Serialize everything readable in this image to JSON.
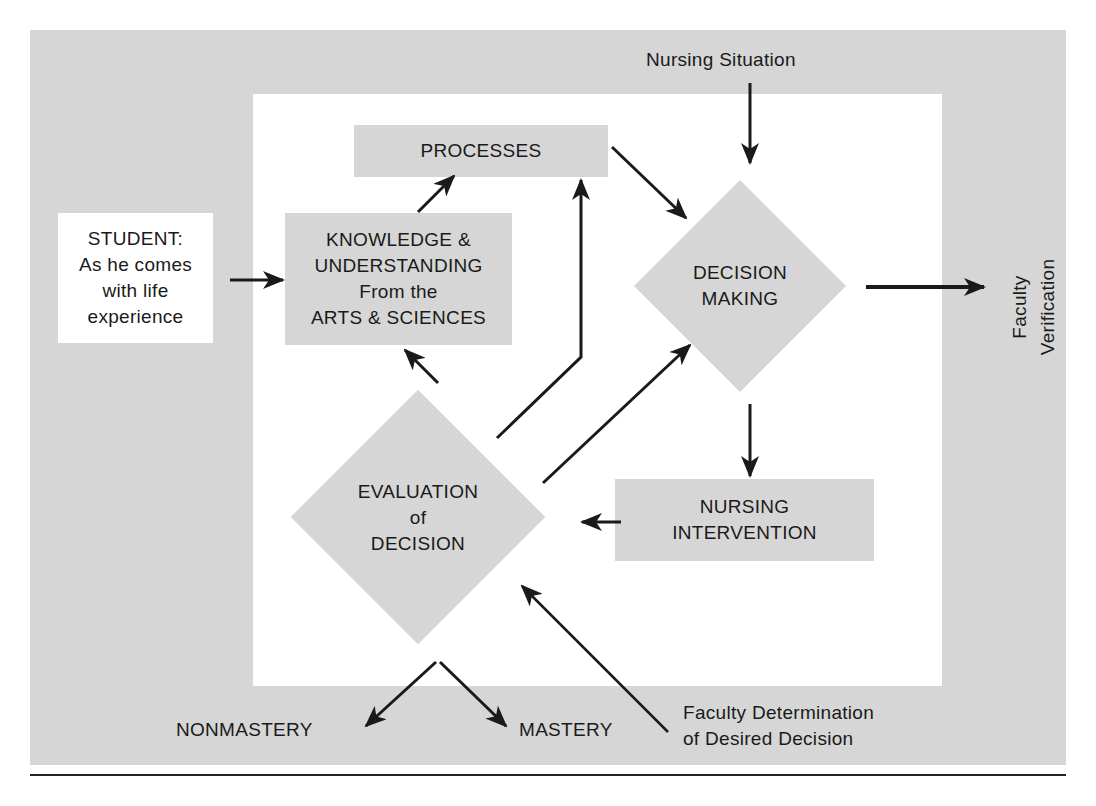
{
  "diagram": {
    "nodes": {
      "student": {
        "line1": "STUDENT:",
        "line2": "As he comes",
        "line3": "with life",
        "line4": "experience"
      },
      "knowledge": {
        "line1": "KNOWLEDGE &",
        "line2": "UNDERSTANDING",
        "line3": "From the",
        "line4": "ARTS & SCIENCES"
      },
      "processes": {
        "label": "PROCESSES"
      },
      "decision_making": {
        "line1": "DECISION",
        "line2": "MAKING"
      },
      "evaluation": {
        "line1": "EVALUATION",
        "line2": "of",
        "line3": "DECISION"
      },
      "nursing_intervention": {
        "line1": "NURSING",
        "line2": "INTERVENTION"
      }
    },
    "labels": {
      "nursing_situation": "Nursing Situation",
      "faculty_verification_1": "Faculty",
      "faculty_verification_2": "Verification",
      "nonmastery": "NONMASTERY",
      "mastery": "MASTERY",
      "faculty_determination_1": "Faculty Determination",
      "faculty_determination_2": "of Desired Decision"
    },
    "colors": {
      "panel": "#d6d6d6",
      "inner": "#ffffff",
      "ink": "#1a1a1a"
    }
  }
}
